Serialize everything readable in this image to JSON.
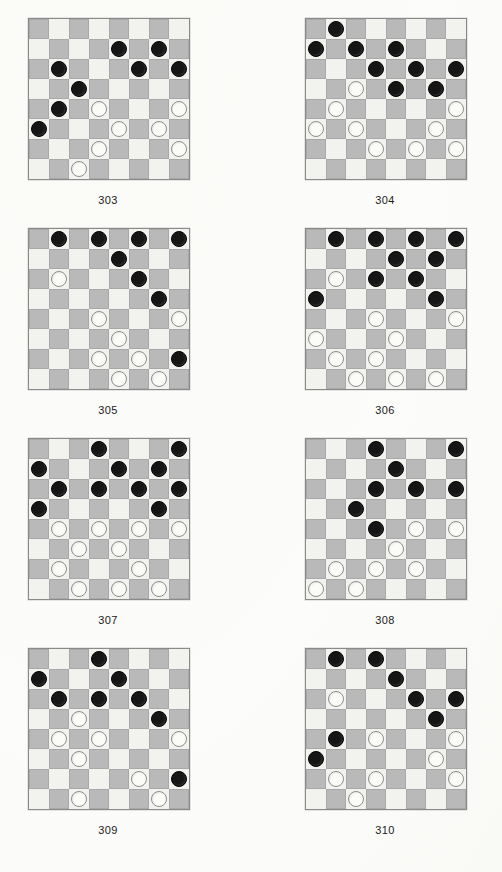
{
  "document": {
    "type": "checkers-puzzle-worksheet",
    "page_number": "",
    "board_size": 8,
    "colors": {
      "light_square": "#f2f2ef",
      "dark_square": "#b9b9b9",
      "black_piece": "#151515",
      "white_piece": "#fbfbf8",
      "board_border": "#8a8a8a",
      "page_background": "#fcfcfb"
    }
  },
  "diagrams": [
    {
      "caption": "303",
      "black": [
        [
          1,
          4
        ],
        [
          1,
          6
        ],
        [
          2,
          1
        ],
        [
          2,
          5
        ],
        [
          2,
          7
        ],
        [
          3,
          2
        ],
        [
          4,
          1
        ],
        [
          5,
          0
        ]
      ],
      "white": [
        [
          4,
          3
        ],
        [
          4,
          7
        ],
        [
          5,
          4
        ],
        [
          5,
          6
        ],
        [
          6,
          3
        ],
        [
          6,
          7
        ],
        [
          7,
          2
        ]
      ]
    },
    {
      "caption": "304",
      "black": [
        [
          0,
          1
        ],
        [
          1,
          0
        ],
        [
          1,
          2
        ],
        [
          1,
          4
        ],
        [
          2,
          3
        ],
        [
          2,
          5
        ],
        [
          2,
          7
        ],
        [
          3,
          4
        ],
        [
          3,
          6
        ]
      ],
      "white": [
        [
          3,
          2
        ],
        [
          4,
          1
        ],
        [
          4,
          7
        ],
        [
          5,
          0
        ],
        [
          5,
          2
        ],
        [
          5,
          6
        ],
        [
          6,
          3
        ],
        [
          6,
          5
        ],
        [
          6,
          7
        ]
      ]
    },
    {
      "caption": "305",
      "black": [
        [
          0,
          1
        ],
        [
          0,
          3
        ],
        [
          0,
          5
        ],
        [
          0,
          7
        ],
        [
          1,
          4
        ],
        [
          2,
          5
        ],
        [
          3,
          6
        ],
        [
          6,
          7
        ]
      ],
      "white": [
        [
          2,
          1
        ],
        [
          4,
          3
        ],
        [
          4,
          7
        ],
        [
          5,
          4
        ],
        [
          6,
          3
        ],
        [
          6,
          5
        ],
        [
          7,
          4
        ],
        [
          7,
          6
        ]
      ]
    },
    {
      "caption": "306",
      "black": [
        [
          0,
          1
        ],
        [
          0,
          3
        ],
        [
          0,
          5
        ],
        [
          0,
          7
        ],
        [
          1,
          4
        ],
        [
          1,
          6
        ],
        [
          2,
          3
        ],
        [
          2,
          5
        ],
        [
          3,
          0
        ],
        [
          3,
          6
        ]
      ],
      "white": [
        [
          2,
          1
        ],
        [
          4,
          3
        ],
        [
          4,
          7
        ],
        [
          5,
          0
        ],
        [
          5,
          4
        ],
        [
          6,
          1
        ],
        [
          6,
          3
        ],
        [
          7,
          2
        ],
        [
          7,
          4
        ],
        [
          7,
          6
        ]
      ]
    },
    {
      "caption": "307",
      "black": [
        [
          0,
          3
        ],
        [
          0,
          7
        ],
        [
          1,
          0
        ],
        [
          1,
          4
        ],
        [
          1,
          6
        ],
        [
          2,
          1
        ],
        [
          2,
          3
        ],
        [
          2,
          5
        ],
        [
          2,
          7
        ],
        [
          3,
          0
        ],
        [
          3,
          6
        ]
      ],
      "white": [
        [
          4,
          1
        ],
        [
          4,
          3
        ],
        [
          4,
          5
        ],
        [
          4,
          7
        ],
        [
          5,
          2
        ],
        [
          5,
          4
        ],
        [
          6,
          1
        ],
        [
          6,
          5
        ],
        [
          7,
          2
        ],
        [
          7,
          4
        ],
        [
          7,
          6
        ]
      ]
    },
    {
      "caption": "308",
      "black": [
        [
          0,
          3
        ],
        [
          0,
          7
        ],
        [
          1,
          4
        ],
        [
          2,
          3
        ],
        [
          2,
          5
        ],
        [
          2,
          7
        ],
        [
          3,
          2
        ],
        [
          4,
          3
        ]
      ],
      "white": [
        [
          4,
          5
        ],
        [
          4,
          7
        ],
        [
          5,
          4
        ],
        [
          6,
          1
        ],
        [
          6,
          3
        ],
        [
          6,
          5
        ],
        [
          7,
          0
        ],
        [
          7,
          2
        ]
      ]
    },
    {
      "caption": "309",
      "black": [
        [
          0,
          3
        ],
        [
          1,
          0
        ],
        [
          1,
          4
        ],
        [
          2,
          1
        ],
        [
          2,
          3
        ],
        [
          2,
          5
        ],
        [
          3,
          6
        ],
        [
          6,
          7
        ]
      ],
      "white": [
        [
          3,
          2
        ],
        [
          4,
          1
        ],
        [
          4,
          3
        ],
        [
          4,
          7
        ],
        [
          5,
          2
        ],
        [
          6,
          5
        ],
        [
          7,
          2
        ],
        [
          7,
          6
        ]
      ]
    },
    {
      "caption": "310",
      "black": [
        [
          0,
          1
        ],
        [
          0,
          3
        ],
        [
          1,
          4
        ],
        [
          2,
          5
        ],
        [
          2,
          7
        ],
        [
          3,
          6
        ],
        [
          4,
          1
        ],
        [
          5,
          0
        ]
      ],
      "white": [
        [
          2,
          1
        ],
        [
          4,
          3
        ],
        [
          4,
          7
        ],
        [
          5,
          6
        ],
        [
          6,
          1
        ],
        [
          6,
          3
        ],
        [
          6,
          7
        ],
        [
          7,
          2
        ]
      ]
    }
  ]
}
